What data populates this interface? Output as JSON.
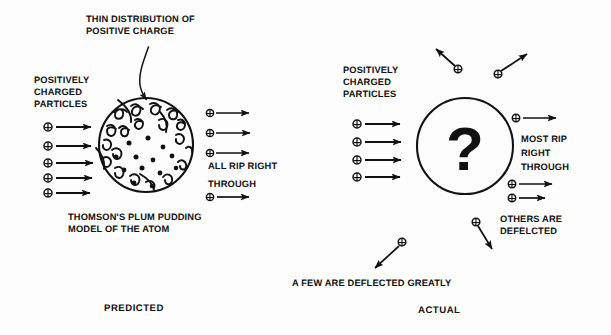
{
  "figure": {
    "title_note": "Comparison of the predicted and actual results of the gold foil scattering experiment",
    "ink_color": "#111111",
    "background_color": "#fdfdfd",
    "width": 611,
    "height": 335
  },
  "predicted_panel": {
    "caption": "PREDICTED",
    "callout_label_line1": "THIN DISTRIBUTION OF",
    "callout_label_line2": "POSITIVE CHARGE",
    "incoming_label_line1": "POSITIVELY",
    "incoming_label_line2": "CHARGED",
    "incoming_label_line3": "PARTICLES",
    "outcome_label_line1": "ALL RIP RIGHT",
    "outcome_label_line2": "THROUGH",
    "model_label_line1": "THOMSON'S PLUM PUDDING",
    "model_label_line2": "MODEL OF THE ATOM",
    "incoming_beam_count": 5,
    "outgoing_beam_count": 4,
    "atom": {
      "center_x": 146,
      "center_y": 145,
      "radius": 47,
      "electron_dot_count": 13
    }
  },
  "actual_panel": {
    "caption": "ACTUAL",
    "incoming_label_line1": "POSITIVELY",
    "incoming_label_line2": "CHARGED",
    "incoming_label_line3": "PARTICLES",
    "outcome_label_line1": "MOST RIP",
    "outcome_label_line2": "RIGHT",
    "outcome_label_line3": "THROUGH",
    "deflected_label_line1": "OTHERS ARE",
    "deflected_label_line2": "DEFELCTED",
    "backscatter_label": "A FEW ARE DEFLECTED GREATLY",
    "nucleus_symbol": "?",
    "incoming_beam_count": 4,
    "straight_through_count": 3,
    "deflected_particle_count": 4,
    "atom": {
      "center_x": 465,
      "center_y": 146,
      "radius": 48
    }
  },
  "icons": {
    "positive_charge": "circle-plus-icon",
    "arrow": "arrow-right-icon",
    "callout": "curved-pointer-icon"
  }
}
